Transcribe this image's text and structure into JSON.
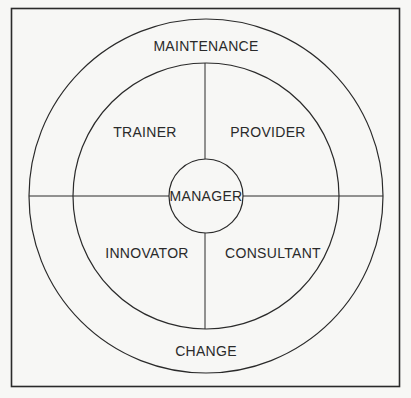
{
  "diagram": {
    "type": "concentric-roles-wheel",
    "colors": {
      "background": "#f7f7f5",
      "stroke": "#2a2a2a",
      "text": "#2a2a2a"
    },
    "outer_ring": {
      "top_label": "MAINTENANCE",
      "bottom_label": "CHANGE"
    },
    "quadrants": {
      "top_left": "TRAINER",
      "top_right": "PROVIDER",
      "bottom_left": "INNOVATOR",
      "bottom_right": "CONSULTANT"
    },
    "center": "MANAGER"
  }
}
